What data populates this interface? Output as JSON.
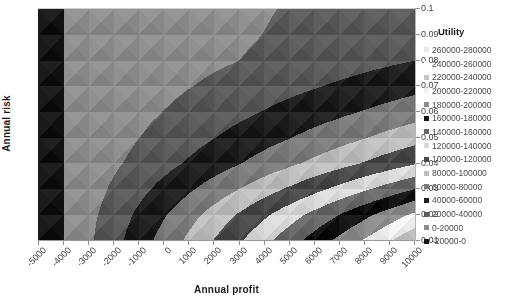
{
  "chart_data": {
    "type": "heatmap",
    "subtype": "filled-contour-surface",
    "title": "",
    "xlabel": "Annual profit",
    "ylabel": "Annual risk",
    "legend_title": "Utility",
    "x_tick_labels": [
      "-5000",
      "-4000",
      "-3000",
      "-2000",
      "-1000",
      "0",
      "1000",
      "2000",
      "3000",
      "4000",
      "5000",
      "6000",
      "7000",
      "8000",
      "9000",
      "10000"
    ],
    "y_tick_labels_top_to_bottom": [
      "0.1",
      "0.09",
      "0.08",
      "0.07",
      "0.06",
      "0.05",
      "0.04",
      "0.03",
      "0.02",
      "0.01"
    ],
    "x_range": [
      -5000,
      10000
    ],
    "y_range": [
      0.01,
      0.1
    ],
    "band_min": -20000,
    "band_step": 20000,
    "bands_ascending": [
      {
        "label": "-20000-0",
        "color": "#161616"
      },
      {
        "label": "0-20000",
        "color": "#8d8d8d"
      },
      {
        "label": "20000-40000",
        "color": "#5a5a5a"
      },
      {
        "label": "40000-60000",
        "color": "#1f1f1f"
      },
      {
        "label": "60000-80000",
        "color": "#7b7b7b"
      },
      {
        "label": "80000-100000",
        "color": "#bdbdbd"
      },
      {
        "label": "100000-120000",
        "color": "#4a4a4a"
      },
      {
        "label": "120000-140000",
        "color": "#d9d9d9"
      },
      {
        "label": "140000-160000",
        "color": "#696969"
      },
      {
        "label": "160000-180000",
        "color": "#121212"
      },
      {
        "label": "180000-200000",
        "color": "#8c8c8c"
      },
      {
        "label": "200000-220000",
        "color": "#f2f2f2"
      },
      {
        "label": "220000-240000",
        "color": "#c6c6c6"
      },
      {
        "label": "240000-260000",
        "color": "#fdfdfd"
      },
      {
        "label": "260000-280000",
        "color": "#e9e9e9"
      }
    ],
    "profits": [
      -5000,
      -4000,
      -3000,
      -2000,
      -1000,
      0,
      1000,
      2000,
      3000,
      4000,
      5000,
      6000,
      7000,
      8000,
      9000,
      10000
    ],
    "risks_top_to_bottom": [
      0.1,
      0.09,
      0.08,
      0.07,
      0.06,
      0.05,
      0.04,
      0.03,
      0.02,
      0.01
    ],
    "utility_grid_rows_top_to_bottom": [
      [
        -2350,
        0,
        2350,
        4700,
        7050,
        9400,
        11750,
        14100,
        16450,
        18800,
        21150,
        23500,
        25850,
        28200,
        30550,
        32900
      ],
      [
        -2530,
        0,
        2530,
        5060,
        7590,
        10120,
        12650,
        15180,
        17710,
        20240,
        22770,
        25300,
        27830,
        30360,
        32890,
        35420
      ],
      [
        -2860,
        0,
        2860,
        5720,
        8580,
        11440,
        14300,
        17160,
        20020,
        22880,
        25740,
        28600,
        31460,
        34320,
        37180,
        40040
      ],
      [
        -3880,
        0,
        3880,
        7760,
        11640,
        15520,
        19400,
        23280,
        27160,
        31040,
        34920,
        38800,
        42680,
        46560,
        50440,
        54320
      ],
      [
        -5100,
        0,
        5100,
        10200,
        15300,
        20400,
        25500,
        30600,
        35700,
        40800,
        45900,
        51000,
        56100,
        61200,
        66300,
        71400
      ],
      [
        -6600,
        0,
        6600,
        13200,
        19800,
        26400,
        33000,
        39600,
        46200,
        52800,
        59400,
        66000,
        72600,
        79200,
        85800,
        92400
      ],
      [
        -8460,
        0,
        8460,
        16920,
        25380,
        33840,
        42300,
        50760,
        59220,
        67680,
        76140,
        84600,
        93060,
        101520,
        109980,
        118440
      ],
      [
        -11430,
        0,
        11430,
        22860,
        34290,
        45720,
        57150,
        68580,
        80010,
        91440,
        102870,
        114300,
        125730,
        137160,
        148590,
        160020
      ],
      [
        -14570,
        0,
        14570,
        29140,
        43710,
        58280,
        72850,
        87420,
        101990,
        116560,
        131130,
        145700,
        160270,
        174840,
        189410,
        203980
      ],
      [
        -16800,
        0,
        16800,
        33600,
        50400,
        67200,
        84000,
        100800,
        117600,
        134400,
        151200,
        168000,
        184800,
        201600,
        218400,
        235200
      ]
    ],
    "colors": {
      "axis": "#9a9a9a",
      "tick_label": "#3f3f3f",
      "axis_title": "#1c1c1c",
      "background": "#ffffff"
    }
  }
}
